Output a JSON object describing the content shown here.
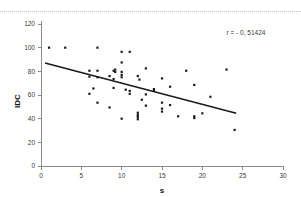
{
  "chart_data": {
    "type": "scatter",
    "title": "",
    "xlabel": "s",
    "ylabel": "IDC",
    "xlim": [
      0,
      30
    ],
    "ylim": [
      0,
      120
    ],
    "xticks": [
      0,
      5,
      10,
      15,
      20,
      25,
      30
    ],
    "yticks": [
      0,
      20,
      40,
      60,
      80,
      100,
      120
    ],
    "xtick_labels": [
      "0",
      "5",
      "10",
      "15",
      "20",
      "25",
      "30"
    ],
    "ytick_labels": [
      "0",
      "20",
      "40",
      "60",
      "80",
      "100",
      "120"
    ],
    "grid": false,
    "legend": null,
    "annotations": [
      {
        "name": "correlation-coefficient",
        "text": "r = - 0, 51424",
        "x": 23.0,
        "y": 111.0
      }
    ],
    "series": [
      {
        "name": "observations",
        "marker": "square",
        "color": "#1a1a1a",
        "points": [
          [
            1,
            100
          ],
          [
            3,
            100
          ],
          [
            7,
            100
          ],
          [
            10,
            96.5
          ],
          [
            11,
            96.5
          ],
          [
            10,
            87.5
          ],
          [
            6,
            80.5
          ],
          [
            7,
            80.5
          ],
          [
            9,
            80.5
          ],
          [
            9.2,
            79.5
          ],
          [
            9.2,
            81.5
          ],
          [
            10,
            79.5
          ],
          [
            10,
            77
          ],
          [
            13,
            82.5
          ],
          [
            18,
            80.5
          ],
          [
            23,
            81.5
          ],
          [
            6,
            75.5
          ],
          [
            7,
            75
          ],
          [
            8.5,
            76
          ],
          [
            10,
            75
          ],
          [
            12,
            76
          ],
          [
            15,
            74
          ],
          [
            12.2,
            73
          ],
          [
            9,
            73.5
          ],
          [
            6.5,
            65.5
          ],
          [
            9,
            66
          ],
          [
            10.5,
            64.5
          ],
          [
            11,
            63.5
          ],
          [
            14,
            65
          ],
          [
            14,
            63.5
          ],
          [
            16,
            67
          ],
          [
            19,
            68.5
          ],
          [
            6,
            61
          ],
          [
            11,
            61
          ],
          [
            13,
            60.5
          ],
          [
            21,
            58.5
          ],
          [
            7,
            53.5
          ],
          [
            12.5,
            56
          ],
          [
            15,
            53.5
          ],
          [
            16,
            51.5
          ],
          [
            13,
            51
          ],
          [
            8.5,
            49.5
          ],
          [
            15,
            48.5
          ],
          [
            15,
            46
          ],
          [
            12,
            45
          ],
          [
            12,
            43
          ],
          [
            12,
            41.5
          ],
          [
            10,
            40
          ],
          [
            12,
            39.5
          ],
          [
            17,
            42
          ],
          [
            19,
            42
          ],
          [
            19,
            40.5
          ],
          [
            20,
            44.5
          ],
          [
            24,
            30.5
          ]
        ]
      }
    ],
    "fit_line": {
      "name": "regression-line",
      "x_start": 0.5,
      "y_start": 87.0,
      "x_end": 24.2,
      "y_end": 44.5,
      "color": "#1a1a1a"
    }
  }
}
